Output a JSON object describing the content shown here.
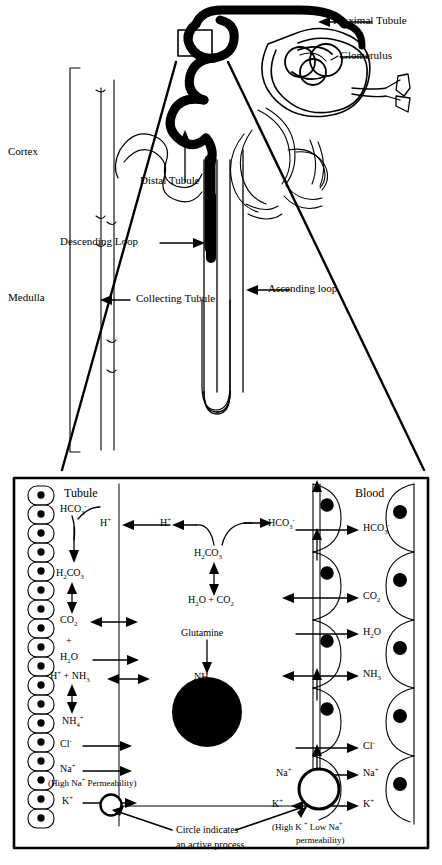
{
  "figure": {
    "ink_color": "#000000",
    "background": "#ffffff"
  },
  "nephron": {
    "region_labels": [
      {
        "name": "cortex",
        "text": "Cortex"
      },
      {
        "name": "medulla",
        "text": "Medulla"
      }
    ],
    "structure_labels": [
      {
        "name": "proximal-tubule",
        "text": "Proximal Tubule"
      },
      {
        "name": "glomerulus",
        "text": "Glomerulus"
      },
      {
        "name": "distal-tubule",
        "text": "Distal Tubule"
      },
      {
        "name": "descending-loop",
        "text": "Descending Loop"
      },
      {
        "name": "ascending-loop",
        "text": "Ascending loop"
      },
      {
        "name": "collecting-tubule",
        "text": "Collecting Tubule"
      }
    ]
  },
  "transport_panel": {
    "compartments": {
      "left": "Tubule",
      "right": "Blood"
    },
    "tubule_column": {
      "species": [
        {
          "name": "bicarbonate",
          "html": "HCO<sub>3</sub><sup>-</sup>"
        },
        {
          "name": "hydrogen-ion",
          "html": "H<sup>+</sup>"
        },
        {
          "name": "carbonic-acid",
          "html": "H<sub>2</sub>CO<sub>3</sub>"
        },
        {
          "name": "carbon-dioxide",
          "html": "CO<sub>2</sub>"
        },
        {
          "name": "plus-sign",
          "html": "+"
        },
        {
          "name": "water",
          "html": "H<sub>2</sub>O"
        },
        {
          "name": "hydrogen-plus-ammonia",
          "html": "H<sup>+</sup> + NH<sub>3</sub>"
        },
        {
          "name": "ammonium",
          "html": "NH<sub>4</sub><sup>+</sup>"
        },
        {
          "name": "chloride",
          "html": "Cl<sup>-</sup>"
        },
        {
          "name": "sodium",
          "html": "Na<sup>+</sup>"
        },
        {
          "name": "potassium",
          "html": "K<sup>+</sup>"
        }
      ],
      "note": "(High Na<sup>+</sup> Permeability)"
    },
    "cell_column": {
      "species": [
        {
          "name": "hydrogen-ion-cell",
          "html": "H<sup>+</sup>"
        },
        {
          "name": "carbonic-acid-cell",
          "html": "H<sub>2</sub>CO<sub>3</sub>"
        },
        {
          "name": "water-plus-co2",
          "html": "H<sub>2</sub>O + CO<sub>2</sub>"
        },
        {
          "name": "bicarbonate-cell",
          "html": "HCO<sub>3</sub><sup>-</sup>"
        },
        {
          "name": "glutamine",
          "html": "Glutamine"
        },
        {
          "name": "ammonia-cell",
          "html": "NH<sub>3</sub>"
        }
      ]
    },
    "blood_column": {
      "species": [
        {
          "name": "bicarbonate-blood",
          "html": "HCO<sub>3</sub><sup>-</sup>"
        },
        {
          "name": "carbon-dioxide-blood",
          "html": "CO<sub>2</sub>"
        },
        {
          "name": "water-blood",
          "html": "H<sub>2</sub>O"
        },
        {
          "name": "ammonia-blood",
          "html": "NH<sub>3</sub>"
        },
        {
          "name": "chloride-blood",
          "html": "Cl<sup>-</sup>"
        },
        {
          "name": "sodium-blood-inner",
          "html": "Na<sup>+</sup>"
        },
        {
          "name": "sodium-blood",
          "html": "Na<sup>+</sup>"
        },
        {
          "name": "potassium-blood-inner",
          "html": "K<sup>+</sup>"
        },
        {
          "name": "potassium-blood",
          "html": "K<sup>+</sup>"
        }
      ],
      "note_line1": "(High K <sup>+</sup> Low Na<sup>+</sup>",
      "note_line2": "permeability)"
    },
    "legend": {
      "line1": "Circle indicates",
      "line2": "an active process"
    }
  }
}
